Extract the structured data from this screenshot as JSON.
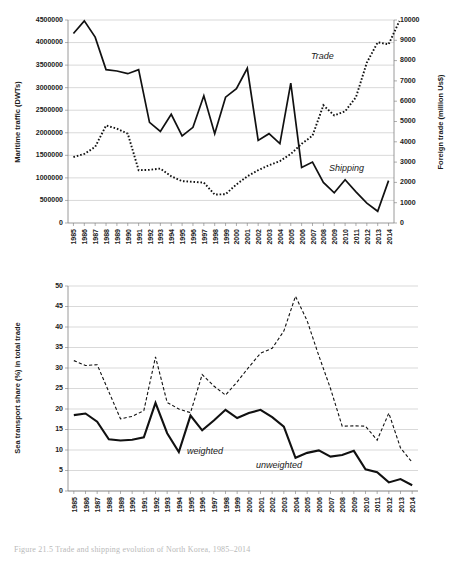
{
  "caption": "Figure 21.5 Trade and shipping evolution of North Korea, 1985–2014",
  "top_chart": {
    "left_axis_title": "Maritime traffic (DWTs)",
    "right_axis_title": "Foreign trade (million Us$)",
    "left_ticks": [
      "0",
      "500000",
      "1000000",
      "1500000",
      "2000000",
      "2500000",
      "3000000",
      "3500000",
      "4000000",
      "4500000"
    ],
    "right_ticks": [
      "0",
      "1000",
      "2000",
      "3000",
      "4000",
      "5000",
      "6000",
      "7000",
      "8000",
      "9000",
      "10000"
    ],
    "annotation_trade": "Trade",
    "annotation_shipping": "Shipping"
  },
  "bottom_chart": {
    "left_axis_title": "Sea transport share (%) in total trade",
    "left_ticks": [
      "0",
      "5",
      "10",
      "15",
      "20",
      "25",
      "30",
      "35",
      "40",
      "45",
      "50"
    ],
    "annotation_unweighted": "unweighted",
    "annotation_weighted": "weighted"
  },
  "chart_data": [
    {
      "type": "line",
      "title": "",
      "xlabel": "",
      "ylabel": "Maritime traffic (DWTs)",
      "y2label": "Foreign trade (million Us$)",
      "ylim": [
        0,
        4500000
      ],
      "y2lim": [
        0,
        10000
      ],
      "grid": true,
      "legend": "inline-annotations",
      "categories": [
        1985,
        1986,
        1987,
        1988,
        1989,
        1990,
        1991,
        1992,
        1993,
        1994,
        1995,
        1996,
        1997,
        1998,
        1999,
        2000,
        2001,
        2002,
        2003,
        2004,
        2005,
        2006,
        2007,
        2008,
        2009,
        2010,
        2011,
        2012,
        2013,
        2014
      ],
      "series": [
        {
          "name": "Shipping",
          "axis": "left",
          "style": "solid",
          "units": "DWTs",
          "values": [
            4200000,
            4480000,
            4120000,
            3400000,
            3370000,
            3310000,
            3400000,
            2230000,
            2030000,
            2410000,
            1930000,
            2120000,
            2820000,
            1980000,
            2790000,
            2980000,
            3430000,
            1830000,
            1980000,
            1760000,
            3100000,
            1230000,
            1350000,
            900000,
            670000,
            960000,
            690000,
            440000,
            260000,
            940000
          ]
        },
        {
          "name": "Trade",
          "axis": "right",
          "style": "dotted",
          "units": "million Us$",
          "values": [
            3250,
            3400,
            3750,
            4800,
            4650,
            4400,
            2600,
            2620,
            2680,
            2300,
            2060,
            2030,
            1990,
            1400,
            1420,
            1900,
            2300,
            2600,
            2850,
            3050,
            3400,
            3900,
            4300,
            5800,
            5300,
            5500,
            6200,
            7900,
            8900,
            8800,
            9950
          ]
        }
      ]
    },
    {
      "type": "line",
      "title": "",
      "xlabel": "",
      "ylabel": "Sea transport share (%) in total trade",
      "ylim": [
        0,
        50
      ],
      "grid": true,
      "legend": "inline-annotations",
      "categories": [
        1985,
        1986,
        1987,
        1988,
        1989,
        1990,
        1991,
        1992,
        1993,
        1994,
        1995,
        1996,
        1997,
        1998,
        1999,
        2000,
        2001,
        2002,
        2003,
        2004,
        2005,
        2006,
        2007,
        2008,
        2009,
        2010,
        2011,
        2012,
        2013,
        2014
      ],
      "series": [
        {
          "name": "unweighted",
          "style": "dashed",
          "units": "%",
          "values": [
            31.8,
            30.6,
            30.8,
            24.2,
            17.6,
            18.2,
            19.6,
            32.7,
            21.6,
            20.0,
            19.1,
            28.4,
            25.6,
            23.4,
            26.6,
            30.2,
            33.6,
            34.8,
            39.0,
            47.5,
            41.5,
            33.0,
            25.0,
            15.8,
            15.9,
            15.8,
            12.4,
            19.0,
            10.5,
            7.0
          ]
        },
        {
          "name": "weighted",
          "style": "solid",
          "units": "%",
          "values": [
            18.5,
            18.9,
            16.9,
            12.6,
            12.3,
            12.5,
            13.1,
            21.5,
            14.1,
            9.5,
            18.4,
            14.8,
            17.2,
            19.8,
            17.8,
            19.0,
            19.8,
            18.0,
            15.7,
            8.1,
            9.3,
            9.9,
            8.4,
            8.8,
            9.8,
            5.3,
            4.6,
            2.1,
            2.9,
            1.4
          ]
        }
      ]
    }
  ]
}
